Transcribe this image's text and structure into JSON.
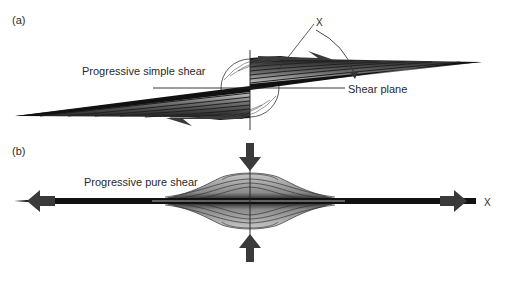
{
  "figure": {
    "panel_a": {
      "label": "(a)",
      "title": "Progressive simple shear",
      "shear_plane_label": "Shear plane",
      "axis_label": "X"
    },
    "panel_b": {
      "label": "(b)",
      "title": "Progressive pure shear",
      "axis_label": "X"
    }
  },
  "colors": {
    "ink": "#1a1a1a",
    "arrow": "#3a3a3a",
    "band_light": "#d8d8d8",
    "band_mid": "#9a9a9a",
    "band_dark": "#3a3a3a"
  }
}
